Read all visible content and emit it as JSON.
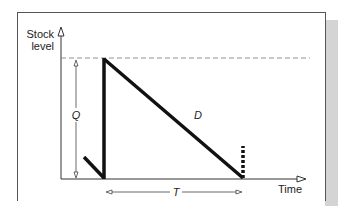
{
  "diagram": {
    "type": "inventory-sawtooth",
    "y_axis_label_line1": "Stock",
    "y_axis_label_line2": "level",
    "x_axis_label": "Time",
    "quantity_label": "Q",
    "demand_label": "D",
    "cycle_label": "T",
    "colors": {
      "line": "#111111",
      "axis": "#333333",
      "dashed": "#666666",
      "frame": "#555555",
      "shadow": "#d4d4d4"
    }
  }
}
